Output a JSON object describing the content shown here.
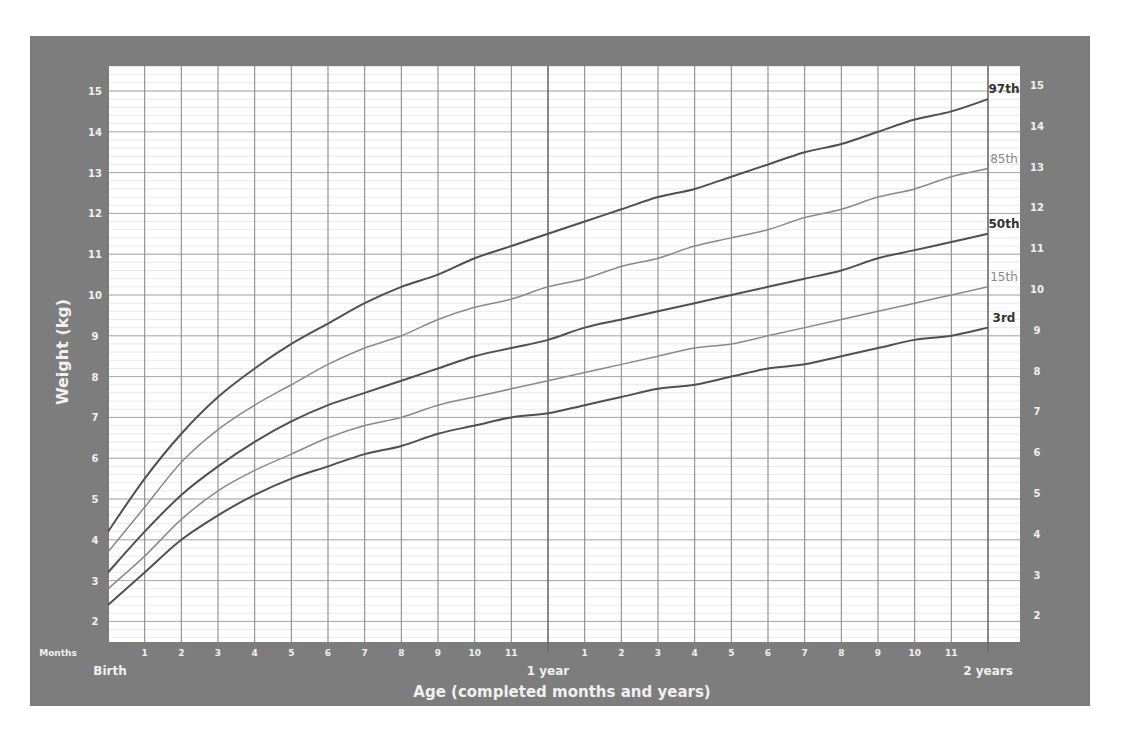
{
  "chart_data": {
    "type": "line",
    "title": "",
    "xlabel": "Age (completed months and years)",
    "ylabel": "Weight (kg)",
    "xunit_label": "Months",
    "x_start_label": "Birth",
    "x_year_labels": [
      "1 year",
      "2 years"
    ],
    "x_month_ticks": [
      "1",
      "2",
      "3",
      "4",
      "5",
      "6",
      "7",
      "8",
      "9",
      "10",
      "11",
      "",
      "1",
      "2",
      "3",
      "4",
      "5",
      "6",
      "7",
      "8",
      "9",
      "10",
      "11",
      ""
    ],
    "ylim": [
      2,
      15
    ],
    "xlim": [
      0,
      24
    ],
    "y_ticks": [
      2,
      3,
      4,
      5,
      6,
      7,
      8,
      9,
      10,
      11,
      12,
      13,
      14,
      15
    ],
    "grid": true,
    "x": [
      0,
      1,
      2,
      3,
      4,
      5,
      6,
      7,
      8,
      9,
      10,
      11,
      12,
      13,
      14,
      15,
      16,
      17,
      18,
      19,
      20,
      21,
      22,
      23,
      24
    ],
    "series": [
      {
        "name": "97th",
        "color": "#505050",
        "bold": true,
        "values": [
          4.2,
          5.5,
          6.6,
          7.5,
          8.2,
          8.8,
          9.3,
          9.8,
          10.2,
          10.5,
          10.9,
          11.2,
          11.5,
          11.8,
          12.1,
          12.4,
          12.6,
          12.9,
          13.2,
          13.5,
          13.7,
          14.0,
          14.3,
          14.5,
          14.8
        ]
      },
      {
        "name": "85th",
        "color": "#8a8a8a",
        "bold": false,
        "values": [
          3.7,
          4.8,
          5.9,
          6.7,
          7.3,
          7.8,
          8.3,
          8.7,
          9.0,
          9.4,
          9.7,
          9.9,
          10.2,
          10.4,
          10.7,
          10.9,
          11.2,
          11.4,
          11.6,
          11.9,
          12.1,
          12.4,
          12.6,
          12.9,
          13.1
        ]
      },
      {
        "name": "50th",
        "color": "#505050",
        "bold": true,
        "values": [
          3.2,
          4.2,
          5.1,
          5.8,
          6.4,
          6.9,
          7.3,
          7.6,
          7.9,
          8.2,
          8.5,
          8.7,
          8.9,
          9.2,
          9.4,
          9.6,
          9.8,
          10.0,
          10.2,
          10.4,
          10.6,
          10.9,
          11.1,
          11.3,
          11.5
        ]
      },
      {
        "name": "15th",
        "color": "#8a8a8a",
        "bold": false,
        "values": [
          2.8,
          3.6,
          4.5,
          5.2,
          5.7,
          6.1,
          6.5,
          6.8,
          7.0,
          7.3,
          7.5,
          7.7,
          7.9,
          8.1,
          8.3,
          8.5,
          8.7,
          8.8,
          9.0,
          9.2,
          9.4,
          9.6,
          9.8,
          10.0,
          10.2
        ]
      },
      {
        "name": "3rd",
        "color": "#505050",
        "bold": true,
        "values": [
          2.4,
          3.2,
          4.0,
          4.6,
          5.1,
          5.5,
          5.8,
          6.1,
          6.3,
          6.6,
          6.8,
          7.0,
          7.1,
          7.3,
          7.5,
          7.7,
          7.8,
          8.0,
          8.2,
          8.3,
          8.5,
          8.7,
          8.9,
          9.0,
          9.2
        ]
      }
    ]
  }
}
